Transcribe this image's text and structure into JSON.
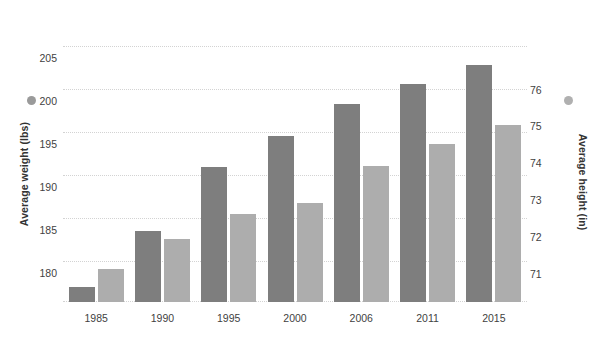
{
  "chart_data": {
    "type": "bar",
    "title": "",
    "xlabel": "",
    "categories": [
      "1985",
      "1990",
      "1995",
      "2000",
      "2006",
      "2011",
      "2015"
    ],
    "series": [
      {
        "name": "Average weight (lbs)",
        "axis": "left",
        "color": "#7e7e7e",
        "values": [
          177.0,
          183.5,
          191.0,
          194.5,
          198.3,
          200.6,
          202.8
        ]
      },
      {
        "name": "Average height (in)",
        "axis": "right",
        "color": "#adadad",
        "values": [
          70.8,
          71.6,
          72.3,
          72.6,
          73.6,
          74.2,
          74.7
        ]
      }
    ],
    "left_axis": {
      "label": "Average weight (lbs)",
      "ticks": [
        180,
        185,
        190,
        195,
        200,
        205
      ],
      "ylim": [
        175.3,
        207.3
      ]
    },
    "right_axis": {
      "label": "Average height (in)",
      "ticks": [
        71,
        72,
        73,
        74,
        75,
        76
      ],
      "ylim": [
        69.9,
        77.4
      ]
    },
    "grid": true,
    "grid_style": "dotted",
    "grid_color": "#d3d3d3",
    "legend_position": "axis-titles",
    "background": "#ffffff"
  },
  "legend": {
    "weight_marker": "circle-marker",
    "height_marker": "circle-marker",
    "weight_color": "#9a9a9a",
    "height_color": "#b0b0b0"
  }
}
